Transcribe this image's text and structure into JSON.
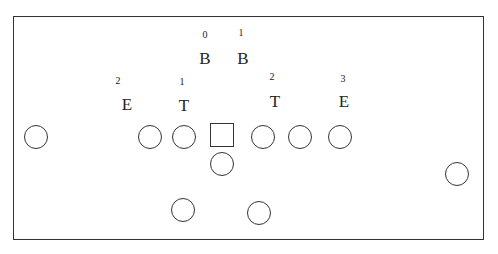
{
  "diagram": {
    "title": "",
    "defense": [
      {
        "label": "B",
        "number": "0",
        "x": 205,
        "y": 58,
        "nx": 205,
        "ny": 35
      },
      {
        "label": "B",
        "number": "1",
        "x": 243,
        "y": 58,
        "nx": 241,
        "ny": 33
      },
      {
        "label": "E",
        "number": "2",
        "x": 127,
        "y": 104,
        "nx": 118,
        "ny": 81
      },
      {
        "label": "T",
        "number": "1",
        "x": 184,
        "y": 105,
        "nx": 182,
        "ny": 82
      },
      {
        "label": "T",
        "number": "2",
        "x": 275,
        "y": 101,
        "nx": 272,
        "ny": 77
      },
      {
        "label": "E",
        "number": "3",
        "x": 344,
        "y": 101,
        "nx": 343,
        "ny": 79
      }
    ],
    "offense_circles": [
      {
        "x": 36,
        "y": 137
      },
      {
        "x": 150,
        "y": 137
      },
      {
        "x": 184,
        "y": 137
      },
      {
        "x": 222,
        "y": 164
      },
      {
        "x": 263,
        "y": 137
      },
      {
        "x": 300,
        "y": 137
      },
      {
        "x": 340,
        "y": 137
      },
      {
        "x": 457,
        "y": 174
      },
      {
        "x": 183,
        "y": 210
      },
      {
        "x": 259,
        "y": 213
      }
    ],
    "center_square": {
      "x": 222,
      "y": 135
    }
  }
}
